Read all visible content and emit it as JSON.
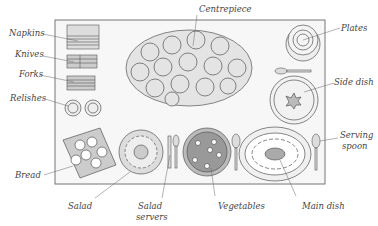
{
  "diagram": {
    "type": "buffet-table-layout",
    "labels": {
      "centrepiece": "Centrepiece",
      "napkins": "Napkins",
      "knives": "Knives",
      "forks": "Forks",
      "relishes": "Relishes",
      "plates": "Plates",
      "side_dish": "Side dish",
      "serving_spoon_1": "Serving",
      "serving_spoon_2": "spoon",
      "bread": "Bread",
      "salad": "Salad",
      "salad_servers_1": "Salad",
      "salad_servers_2": "servers",
      "vegetables": "Vegetables",
      "main_dish": "Main dish"
    },
    "colors": {
      "line": "#555555",
      "table_fill": "#f6f6f6",
      "table_border": "#777777",
      "label_text": "#444444"
    }
  }
}
